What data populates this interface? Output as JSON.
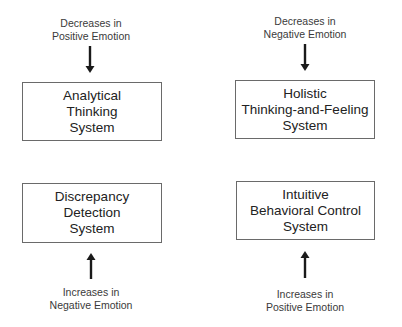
{
  "diagram": {
    "nodes": [
      {
        "id": "analytical",
        "lines": [
          "Analytical",
          "Thinking",
          "System"
        ],
        "input": {
          "lines": [
            "Decreases in",
            "Positive Emotion"
          ],
          "direction": "down"
        }
      },
      {
        "id": "holistic",
        "lines": [
          "Holistic",
          "Thinking-and-Feeling",
          "System"
        ],
        "input": {
          "lines": [
            "Decreases in",
            "Negative Emotion"
          ],
          "direction": "down"
        }
      },
      {
        "id": "discrepancy",
        "lines": [
          "Discrepancy",
          "Detection",
          "System"
        ],
        "input": {
          "lines": [
            "Increases in",
            "Negative Emotion"
          ],
          "direction": "up"
        }
      },
      {
        "id": "intuitive",
        "lines": [
          "Intuitive",
          "Behavioral Control",
          "System"
        ],
        "input": {
          "lines": [
            "Increases in",
            "Positive Emotion"
          ],
          "direction": "up"
        }
      }
    ],
    "colors": {
      "box_border": "#6a6a6a",
      "arrow": "#1a1a1a",
      "text": "#222222"
    }
  }
}
